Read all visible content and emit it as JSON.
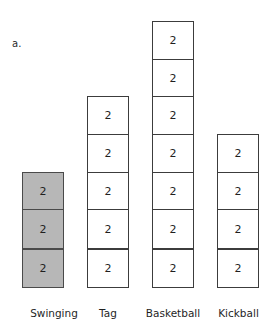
{
  "figure": {
    "part_letter": "a.",
    "cell_value": "2"
  },
  "chart_data": {
    "type": "bar",
    "title": "",
    "subtitle": "",
    "xlabel": "",
    "ylabel": "",
    "categories": [
      "Swinging",
      "Tag",
      "Basketball",
      "Kickball"
    ],
    "values": [
      3,
      5,
      7,
      4
    ],
    "unit_per_cell": 2,
    "scaled_values": [
      6,
      10,
      14,
      8
    ],
    "cell_label": "2",
    "grid": false,
    "legend": "none",
    "ylim": [
      0,
      7
    ],
    "annotations": [
      "a."
    ],
    "series": [
      {
        "name": "Number of students",
        "values": [
          3,
          5,
          7,
          4
        ]
      }
    ],
    "bars": [
      {
        "category": "Swinging",
        "cells": 3,
        "total": 6,
        "fill": "#b7b7b7",
        "highlighted": true
      },
      {
        "category": "Tag",
        "cells": 5,
        "total": 10,
        "fill": "#ffffff",
        "highlighted": false
      },
      {
        "category": "Basketball",
        "cells": 7,
        "total": 14,
        "fill": "#ffffff",
        "highlighted": false
      },
      {
        "category": "Kickball",
        "cells": 4,
        "total": 8,
        "fill": "#ffffff",
        "highlighted": false
      }
    ],
    "colors": {
      "highlight_fill": "#b7b7b7",
      "plain_fill": "#ffffff",
      "border": "#3c3c3c",
      "text": "#1f1f1f",
      "background": "#ffffff"
    }
  }
}
